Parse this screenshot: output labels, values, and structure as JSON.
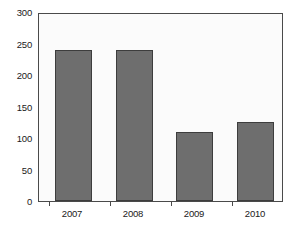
{
  "chart_data": {
    "type": "bar",
    "title": "",
    "subtitle": "",
    "xlabel": "",
    "ylabel": "",
    "categories": [
      "2007",
      "2008",
      "2009",
      "2010"
    ],
    "values": [
      243,
      242,
      110,
      126
    ],
    "series": [
      {
        "name": "Series 1",
        "values": [
          243,
          242,
          110,
          126
        ]
      }
    ],
    "ylim": [
      0,
      300
    ],
    "yticks": [
      0,
      50,
      100,
      150,
      200,
      250,
      300
    ],
    "ytick_labels": [
      "0",
      "50",
      "100",
      "150",
      "200",
      "250",
      "300"
    ],
    "grid": false,
    "legend": false,
    "legend_position": "none",
    "bar_color": "#6e6e6e",
    "bar_edge_color": "#3d3d3d",
    "plot_background": "#fbfbfb",
    "axis_color": "#4a4a4a",
    "text_color": "#1a1a1a",
    "annotations": []
  }
}
